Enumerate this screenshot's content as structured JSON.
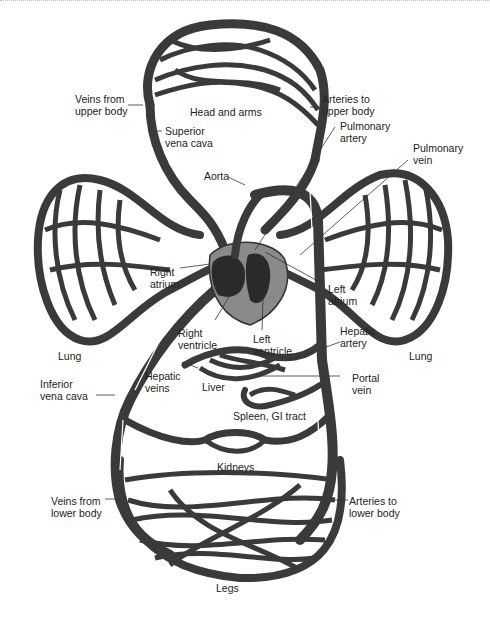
{
  "diagram": {
    "colors": {
      "vessel": "#3a3a3a",
      "heart_fill": "#8a8a8a",
      "heart_dark": "#2a2a2a",
      "background": "#ffffff",
      "text": "#222222"
    },
    "labels": {
      "veins_upper": "Veins from\nupper body",
      "head_arms": "Head and arms",
      "arteries_upper": "Arteries to\nupper body",
      "superior_vena_cava": "Superior\nvena cava",
      "pulmonary_artery": "Pulmonary\nartery",
      "pulmonary_vein": "Pulmonary\nvein",
      "aorta": "Aorta",
      "right_atrium": "Right\natrium",
      "left_atrium": "Left\natrium",
      "right_ventricle": "Right\nventricle",
      "left_ventricle": "Left\nventricle",
      "lung_left": "Lung",
      "lung_right": "Lung",
      "hepatic_artery": "Hepatic\nartery",
      "hepatic_veins": "Hepatic\nveins",
      "liver": "Liver",
      "portal_vein": "Portal\nvein",
      "inferior_vena_cava": "Inferior\nvena cava",
      "spleen_gi": "Spleen, GI tract",
      "kidneys": "Kidneys",
      "veins_lower": "Veins from\nlower body",
      "arteries_lower": "Arteries to\nlower body",
      "legs": "Legs"
    }
  }
}
